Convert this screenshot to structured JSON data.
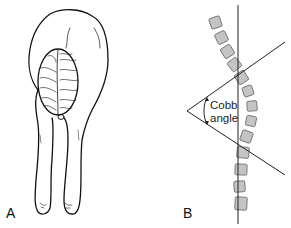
{
  "figure": {
    "panels": [
      {
        "label": "A",
        "description": "Adam forward bend test — patient bending forward showing rib hump"
      },
      {
        "label": "B",
        "description": "Spine schematic with Cobb angle measurement"
      }
    ],
    "annotation": {
      "line1": "Cobb",
      "line2": "angle"
    },
    "colors": {
      "vertebra_fill": "#c4c4c4",
      "vertebra_stroke": "#666666",
      "line": "#222222"
    }
  }
}
